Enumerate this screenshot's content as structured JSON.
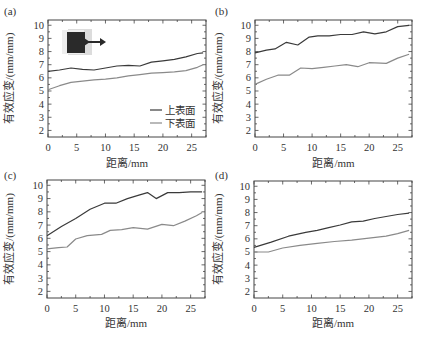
{
  "figure": {
    "xlabel": "距离/mm",
    "ylabel": "有效应变/(mm/mm)",
    "xticks": [
      0,
      5,
      10,
      15,
      20,
      25
    ],
    "yticks": [
      2,
      3,
      4,
      5,
      6,
      7,
      8,
      9,
      10
    ],
    "legend": [
      "上表面",
      "下表面"
    ],
    "colors": {
      "upper": "#3a3a3a",
      "lower": "#8a8a8a",
      "axis": "#444444"
    }
  },
  "chart_data": [
    {
      "type": "line",
      "panel_label": "(a)",
      "title": "",
      "xlabel": "距离/mm",
      "ylabel": "有效应变/(mm/mm)",
      "xlim": [
        0,
        27.5
      ],
      "ylim": [
        1.5,
        10.4
      ],
      "grid": false,
      "legend_position": "lower right",
      "has_inset_image": true,
      "series": [
        {
          "name": "上表面",
          "x": [
            0,
            2,
            4,
            6,
            8,
            10,
            12,
            14,
            16,
            18,
            20,
            22,
            24,
            26,
            27
          ],
          "values": [
            6.5,
            6.6,
            6.75,
            6.65,
            6.6,
            6.75,
            6.9,
            6.95,
            6.9,
            7.2,
            7.3,
            7.4,
            7.6,
            7.85,
            7.9
          ]
        },
        {
          "name": "下表面",
          "x": [
            0,
            2,
            4,
            6,
            8,
            10,
            12,
            14,
            16,
            18,
            20,
            22,
            24,
            26,
            27
          ],
          "values": [
            5.1,
            5.4,
            5.65,
            5.75,
            5.85,
            5.9,
            6.0,
            6.15,
            6.25,
            6.35,
            6.4,
            6.45,
            6.55,
            6.8,
            7.0
          ]
        }
      ]
    },
    {
      "type": "line",
      "panel_label": "(b)",
      "title": "",
      "xlabel": "距离/mm",
      "ylabel": "有效应变/(mm/mm)",
      "xlim": [
        0,
        27.5
      ],
      "ylim": [
        1.5,
        10.4
      ],
      "grid": false,
      "series": [
        {
          "name": "上表面",
          "x": [
            0,
            2,
            3.5,
            5.5,
            7.5,
            9.5,
            11,
            13,
            15,
            17,
            19,
            21,
            23,
            25,
            27
          ],
          "values": [
            7.9,
            8.1,
            8.2,
            8.7,
            8.5,
            9.1,
            9.2,
            9.2,
            9.3,
            9.3,
            9.5,
            9.35,
            9.5,
            9.9,
            10.0
          ]
        },
        {
          "name": "下表面",
          "x": [
            0,
            2,
            4,
            6,
            8,
            10,
            12,
            14,
            16,
            18,
            20,
            23,
            25,
            27
          ],
          "values": [
            5.5,
            5.9,
            6.2,
            6.2,
            6.75,
            6.7,
            6.8,
            6.9,
            7.0,
            6.85,
            7.15,
            7.1,
            7.5,
            7.8
          ]
        }
      ]
    },
    {
      "type": "line",
      "panel_label": "(c)",
      "title": "",
      "xlabel": "距离/mm",
      "ylabel": "有效应变/(mm/mm)",
      "xlim": [
        0,
        27.5
      ],
      "ylim": [
        1.5,
        10.4
      ],
      "grid": false,
      "series": [
        {
          "name": "上表面",
          "x": [
            0,
            2.5,
            5,
            7.5,
            10,
            12,
            14,
            16,
            17.5,
            19,
            21,
            23,
            25,
            27
          ],
          "values": [
            6.2,
            6.9,
            7.5,
            8.2,
            8.65,
            8.65,
            9.0,
            9.25,
            9.45,
            9.0,
            9.45,
            9.45,
            9.5,
            9.5
          ]
        },
        {
          "name": "下表面",
          "x": [
            0,
            2,
            3.5,
            5,
            7,
            9.5,
            11,
            13,
            15,
            17.5,
            20,
            22,
            24,
            26,
            27
          ],
          "values": [
            5.2,
            5.3,
            5.35,
            5.95,
            6.2,
            6.3,
            6.6,
            6.65,
            6.8,
            6.7,
            7.05,
            6.95,
            7.3,
            7.7,
            7.95
          ]
        }
      ]
    },
    {
      "type": "line",
      "panel_label": "(d)",
      "title": "",
      "xlabel": "距离/mm",
      "ylabel": "有效应变/(mm/mm)",
      "xlim": [
        0,
        27.5
      ],
      "ylim": [
        1.5,
        10.4
      ],
      "grid": false,
      "series": [
        {
          "name": "上表面",
          "x": [
            0,
            3,
            6,
            9,
            11,
            13,
            15,
            17,
            19,
            21,
            23,
            25,
            27
          ],
          "values": [
            5.35,
            5.75,
            6.2,
            6.5,
            6.65,
            6.85,
            7.05,
            7.3,
            7.35,
            7.55,
            7.7,
            7.85,
            7.95
          ]
        },
        {
          "name": "下表面",
          "x": [
            0,
            2.5,
            5,
            8,
            11,
            14,
            17,
            20,
            23,
            25,
            27
          ],
          "values": [
            5.0,
            5.0,
            5.3,
            5.5,
            5.65,
            5.8,
            5.9,
            6.05,
            6.2,
            6.4,
            6.65
          ]
        }
      ]
    }
  ]
}
